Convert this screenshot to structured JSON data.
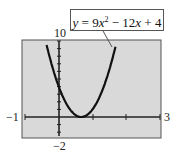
{
  "chart_data": {
    "type": "line",
    "title": "",
    "equation": "y = 9x^2 - 12x + 4",
    "series": [
      {
        "name": "y = 9x^2 - 12x + 4",
        "x": [
          -0.4,
          -0.2,
          0,
          0.2,
          0.4,
          0.6,
          0.6667,
          0.8,
          1.0,
          1.2,
          1.4
        ],
        "y": [
          10.24,
          6.76,
          4,
          1.96,
          0.64,
          0.04,
          0,
          0.16,
          1,
          2.56,
          4.84
        ]
      }
    ],
    "xlim": [
      -1,
      3
    ],
    "ylim": [
      -2,
      10
    ],
    "x_tick_labels": [
      "-1",
      "3"
    ],
    "y_tick_labels": [
      "10",
      "-2"
    ],
    "xlabel": "",
    "ylabel": "",
    "grid": false,
    "vertex": [
      0.6667,
      0
    ],
    "y_intercept": 4
  },
  "labels": {
    "xmin": "−1",
    "xmax": "3",
    "ymax": "10",
    "ymin": "−2",
    "eq_y": "y",
    "eq_eq": " = 9",
    "eq_x1": "x",
    "eq_exp": "2",
    "eq_rest1": " − 12",
    "eq_x2": "x",
    "eq_rest2": " + 4"
  },
  "colors": {
    "plot_bg": "#d9d9d9",
    "curve": "#111111",
    "axis": "#222222"
  }
}
